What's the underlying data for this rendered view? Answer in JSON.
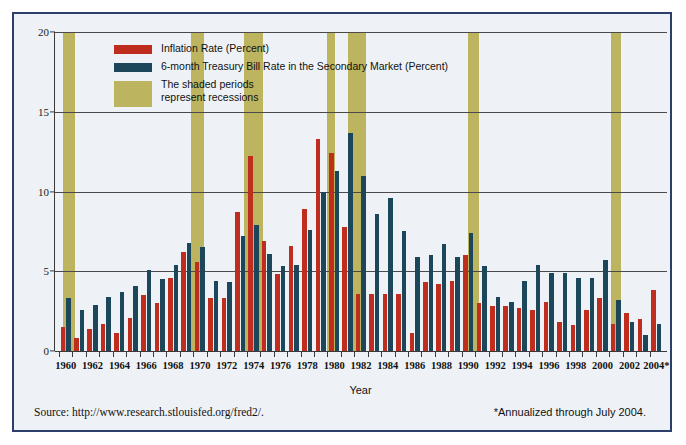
{
  "figure": {
    "background_color": "#eef2f6",
    "border_color": "#2c3f6b"
  },
  "legend": {
    "items": [
      {
        "name": "inflation",
        "label": "Inflation Rate (Percent)",
        "color": "#bf2d1f"
      },
      {
        "name": "tbill",
        "label": "6-month Treasury Bill Rate in the Secondary Market (Percent)",
        "color": "#1c4659"
      },
      {
        "name": "recession",
        "label_line1": "The shaded periods",
        "label_line2": "represent recessions",
        "color": "#bcb45f"
      }
    ]
  },
  "axis_title": "Year",
  "source_note": "Source: http://www.research.stlouisfed.org/fred2/.",
  "footnote": "*Annualized through July 2004.",
  "chart_data": {
    "type": "bar",
    "title": "",
    "xlabel": "Year",
    "ylabel": "",
    "ylim": [
      0,
      20
    ],
    "yticks": [
      0,
      5,
      10,
      15,
      20
    ],
    "ytick_labels": [
      "0",
      "5",
      "10",
      "15",
      "20"
    ],
    "grid": true,
    "legend_position": "upper-left-inside",
    "x": [
      1960,
      1961,
      1962,
      1963,
      1964,
      1965,
      1966,
      1967,
      1968,
      1969,
      1970,
      1971,
      1972,
      1973,
      1974,
      1975,
      1976,
      1977,
      1978,
      1979,
      1980,
      1981,
      1982,
      1983,
      1984,
      1985,
      1986,
      1987,
      1988,
      1989,
      1990,
      1991,
      1992,
      1993,
      1994,
      1995,
      1996,
      1997,
      1998,
      1999,
      2000,
      2001,
      2002,
      2003,
      2004
    ],
    "xtick_labels": [
      "1960",
      "1962",
      "1964",
      "1966",
      "1968",
      "1970",
      "1972",
      "1974",
      "1976",
      "1978",
      "1980",
      "1982",
      "1984",
      "1986",
      "1988",
      "1990",
      "1992",
      "1994",
      "1996",
      "1998",
      "2000",
      "2002",
      "2004*"
    ],
    "series": [
      {
        "name": "Inflation Rate (Percent)",
        "key": "inflation",
        "color": "#bf2d1f",
        "values": [
          1.5,
          0.8,
          1.4,
          1.7,
          1.1,
          2.1,
          3.5,
          3.0,
          4.6,
          6.2,
          5.6,
          3.3,
          3.3,
          8.7,
          12.2,
          6.9,
          4.8,
          6.6,
          8.9,
          13.3,
          12.4,
          7.8,
          3.6,
          3.6,
          3.6,
          3.6,
          1.1,
          4.3,
          4.2,
          4.4,
          6.0,
          3.0,
          2.8,
          2.8,
          2.7,
          2.6,
          3.1,
          1.8,
          1.6,
          2.6,
          3.3,
          1.7,
          2.4,
          2.0,
          3.8
        ]
      },
      {
        "name": "6-month Treasury Bill Rate in the Secondary Market (Percent)",
        "key": "tbill",
        "color": "#1c4659",
        "values": [
          3.3,
          2.6,
          2.9,
          3.4,
          3.7,
          4.1,
          5.1,
          4.5,
          5.4,
          6.8,
          6.5,
          4.4,
          4.3,
          7.2,
          7.9,
          6.1,
          5.3,
          5.4,
          7.6,
          10.0,
          11.3,
          13.7,
          11.0,
          8.6,
          9.6,
          7.5,
          5.9,
          6.0,
          6.7,
          5.9,
          7.4,
          5.3,
          3.4,
          3.1,
          4.4,
          5.4,
          4.9,
          4.9,
          4.6,
          4.6,
          5.7,
          3.2,
          1.8,
          1.0,
          1.7
        ]
      }
    ],
    "recessions": [
      {
        "start": 1960.3,
        "end": 1961.2
      },
      {
        "start": 1969.8,
        "end": 1970.8
      },
      {
        "start": 1973.8,
        "end": 1975.2
      },
      {
        "start": 1980.0,
        "end": 1980.6
      },
      {
        "start": 1981.5,
        "end": 1982.9
      },
      {
        "start": 1990.5,
        "end": 1991.3
      },
      {
        "start": 2001.1,
        "end": 2001.9
      }
    ]
  }
}
